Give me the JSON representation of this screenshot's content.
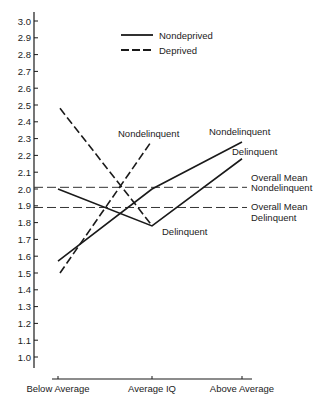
{
  "chart_data": {
    "type": "line",
    "title": "",
    "xlabel": "",
    "ylabel": "",
    "categories": [
      "Below Average",
      "Average IQ",
      "Above Average"
    ],
    "ylim": [
      1.0,
      3.0
    ],
    "yticks": [
      "1.0",
      "1.1",
      "1.2",
      "1.3",
      "1.4",
      "1.5",
      "1.6",
      "1.7",
      "1.8",
      "1.9",
      "2.0",
      "2.1",
      "2.2",
      "2.3",
      "2.4",
      "2.5",
      "2.6",
      "2.7",
      "2.8",
      "2.9",
      "3.0"
    ],
    "grid": false,
    "legend": {
      "position": "top-center",
      "entries": [
        {
          "label": "Nondeprived",
          "style": "solid"
        },
        {
          "label": "Deprived",
          "style": "dashed"
        }
      ]
    },
    "series": [
      {
        "name": "Nondeprived Nondelinquent",
        "group": "Nondeprived",
        "style": "solid",
        "values": [
          1.57,
          2.0,
          2.28
        ],
        "label": "Nondelinquent"
      },
      {
        "name": "Nondeprived Delinquent",
        "group": "Nondeprived",
        "style": "solid",
        "values": [
          2.0,
          1.78,
          2.18
        ],
        "label": "Delinquent"
      },
      {
        "name": "Deprived Nondelinquent",
        "group": "Deprived",
        "style": "dashed",
        "values": [
          1.5,
          2.28,
          null
        ],
        "label": "Nondelinquent"
      },
      {
        "name": "Deprived Delinquent",
        "group": "Deprived",
        "style": "dashed",
        "values": [
          2.48,
          1.79,
          null
        ],
        "label": "Delinquent"
      }
    ],
    "reference_lines": [
      {
        "label_line1": "Overall Mean",
        "label_line2": "Nondelinquent",
        "value": 2.01,
        "style": "long-dash"
      },
      {
        "label_line1": "Overall Mean",
        "label_line2": "Delinquent",
        "value": 1.89,
        "style": "long-dash"
      }
    ],
    "annotations": [
      {
        "text": "Nondelinquent",
        "x": 118,
        "y": 137
      },
      {
        "text": "Delinquent",
        "x": 162,
        "y": 235
      },
      {
        "text": "Nondelinquent",
        "x": 209,
        "y": 135
      },
      {
        "text": "Delinquent",
        "x": 232,
        "y": 155
      }
    ]
  }
}
